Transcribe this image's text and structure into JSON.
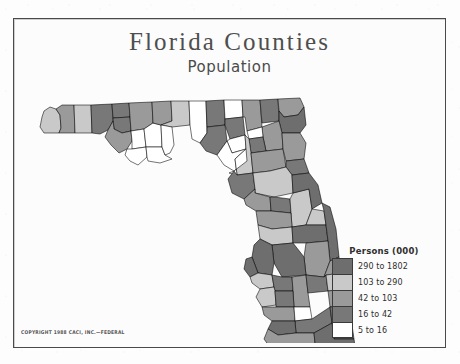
{
  "page": {
    "title": "Florida Counties",
    "subtitle": "Population",
    "copyright": "COPYRIGHT 1988 CACI, INC.—FEDERAL"
  },
  "legend": {
    "title": "Persons (000)",
    "classes": [
      {
        "label": "290 to 1802",
        "color": "#6e6e6e",
        "min": 290,
        "max": 1802
      },
      {
        "label": "103 to 290",
        "color": "#c9c9c9",
        "min": 103,
        "max": 290
      },
      {
        "label": "42 to 103",
        "color": "#9a9a9a",
        "min": 42,
        "max": 103
      },
      {
        "label": "16 to 42",
        "color": "#787878",
        "min": 16,
        "max": 42
      },
      {
        "label": "5 to 16",
        "color": "#ffffff",
        "min": 5,
        "max": 16
      }
    ]
  },
  "chart_data": {
    "type": "choropleth",
    "title": "Florida Counties",
    "subtitle": "Population",
    "unit": "thousands of persons",
    "legend_title": "Persons (000)",
    "class_breaks": [
      5,
      16,
      42,
      103,
      290,
      1802
    ],
    "class_colors": [
      "#ffffff",
      "#787878",
      "#9a9a9a",
      "#c9c9c9",
      "#6e6e6e"
    ],
    "regions": [
      {
        "name": "Escambia",
        "class": 3
      },
      {
        "name": "Santa Rosa",
        "class": 2
      },
      {
        "name": "Okaloosa",
        "class": 3
      },
      {
        "name": "Walton",
        "class": 1
      },
      {
        "name": "Holmes",
        "class": 1
      },
      {
        "name": "Washington",
        "class": 1
      },
      {
        "name": "Bay",
        "class": 2
      },
      {
        "name": "Jackson",
        "class": 2
      },
      {
        "name": "Calhoun",
        "class": 0
      },
      {
        "name": "Gulf",
        "class": 0
      },
      {
        "name": "Liberty",
        "class": 0
      },
      {
        "name": "Franklin",
        "class": 0
      },
      {
        "name": "Gadsden",
        "class": 2
      },
      {
        "name": "Leon",
        "class": 3
      },
      {
        "name": "Wakulla",
        "class": 0
      },
      {
        "name": "Jefferson",
        "class": 0
      },
      {
        "name": "Madison",
        "class": 1
      },
      {
        "name": "Taylor",
        "class": 1
      },
      {
        "name": "Hamilton",
        "class": 0
      },
      {
        "name": "Suwannee",
        "class": 1
      },
      {
        "name": "Lafayette",
        "class": 0
      },
      {
        "name": "Dixie",
        "class": 0
      },
      {
        "name": "Columbia",
        "class": 2
      },
      {
        "name": "Baker",
        "class": 1
      },
      {
        "name": "Nassau",
        "class": 2
      },
      {
        "name": "Duval",
        "class": 4
      },
      {
        "name": "Clay",
        "class": 2
      },
      {
        "name": "Union",
        "class": 0
      },
      {
        "name": "Bradford",
        "class": 1
      },
      {
        "name": "Alachua",
        "class": 3
      },
      {
        "name": "Gilchrist",
        "class": 0
      },
      {
        "name": "Levy",
        "class": 1
      },
      {
        "name": "Putnam",
        "class": 2
      },
      {
        "name": "St. Johns",
        "class": 2
      },
      {
        "name": "Flagler",
        "class": 1
      },
      {
        "name": "Marion",
        "class": 3
      },
      {
        "name": "Citrus",
        "class": 2
      },
      {
        "name": "Sumter",
        "class": 1
      },
      {
        "name": "Lake",
        "class": 3
      },
      {
        "name": "Volusia",
        "class": 4
      },
      {
        "name": "Hernando",
        "class": 2
      },
      {
        "name": "Pasco",
        "class": 3
      },
      {
        "name": "Seminole",
        "class": 3
      },
      {
        "name": "Orange",
        "class": 4
      },
      {
        "name": "Brevard",
        "class": 4
      },
      {
        "name": "Osceola",
        "class": 2
      },
      {
        "name": "Polk",
        "class": 4
      },
      {
        "name": "Hillsborough",
        "class": 4
      },
      {
        "name": "Pinellas",
        "class": 4
      },
      {
        "name": "Manatee",
        "class": 3
      },
      {
        "name": "Hardee",
        "class": 1
      },
      {
        "name": "Highlands",
        "class": 2
      },
      {
        "name": "Indian River",
        "class": 2
      },
      {
        "name": "Okeechobee",
        "class": 1
      },
      {
        "name": "St. Lucie",
        "class": 3
      },
      {
        "name": "Martin",
        "class": 2
      },
      {
        "name": "Sarasota",
        "class": 3
      },
      {
        "name": "DeSoto",
        "class": 1
      },
      {
        "name": "Charlotte",
        "class": 2
      },
      {
        "name": "Glades",
        "class": 0
      },
      {
        "name": "Hendry",
        "class": 1
      },
      {
        "name": "Lee",
        "class": 4
      },
      {
        "name": "Collier",
        "class": 2
      },
      {
        "name": "Palm Beach",
        "class": 4
      },
      {
        "name": "Broward",
        "class": 4
      },
      {
        "name": "Dade",
        "class": 4
      },
      {
        "name": "Monroe",
        "class": 2
      }
    ]
  }
}
